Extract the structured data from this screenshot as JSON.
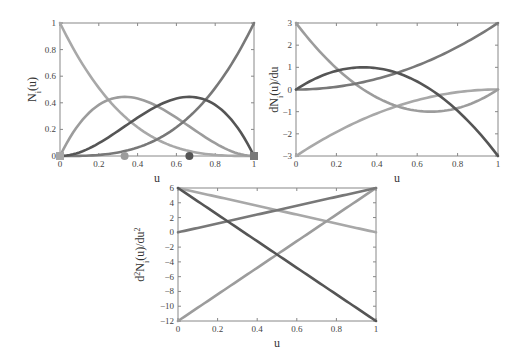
{
  "chart_data": [
    {
      "type": "line",
      "title": "",
      "xlabel": "u",
      "ylabel": "N_i(u)",
      "xlim": [
        0,
        1
      ],
      "ylim": [
        0,
        1
      ],
      "xticks": [
        "0",
        "0.2",
        "0.4",
        "0.6",
        "0.8",
        "1"
      ],
      "yticks": [
        "0",
        "0.2",
        "0.4",
        "0.6",
        "0.8",
        "1"
      ],
      "grid": false,
      "x": [
        0,
        0.1,
        0.2,
        0.3,
        0.4,
        0.5,
        0.6,
        0.7,
        0.8,
        0.9,
        1.0
      ],
      "series": [
        {
          "name": "N0",
          "color": "#a8a8a8",
          "values": [
            1.0,
            0.729,
            0.512,
            0.343,
            0.216,
            0.125,
            0.064,
            0.027,
            0.008,
            0.001,
            0.0
          ]
        },
        {
          "name": "N1",
          "color": "#9c9c9c",
          "values": [
            0.0,
            0.243,
            0.384,
            0.441,
            0.432,
            0.375,
            0.288,
            0.189,
            0.096,
            0.027,
            0.0
          ]
        },
        {
          "name": "N2",
          "color": "#555555",
          "values": [
            0.0,
            0.027,
            0.096,
            0.189,
            0.288,
            0.375,
            0.432,
            0.441,
            0.384,
            0.243,
            0.0
          ]
        },
        {
          "name": "N3",
          "color": "#787878",
          "values": [
            0.0,
            0.001,
            0.008,
            0.027,
            0.064,
            0.125,
            0.216,
            0.343,
            0.512,
            0.729,
            1.0
          ]
        }
      ],
      "markers": [
        {
          "shape": "square",
          "u": 0,
          "value": 0,
          "color": "#a8a8a8"
        },
        {
          "shape": "circle",
          "u": 0.333,
          "value": 0,
          "color": "#9c9c9c"
        },
        {
          "shape": "circle",
          "u": 0.667,
          "value": 0,
          "color": "#555555"
        },
        {
          "shape": "square",
          "u": 1,
          "value": 0,
          "color": "#787878"
        }
      ]
    },
    {
      "type": "line",
      "title": "",
      "xlabel": "u",
      "ylabel": "dN_i(u)/du",
      "xlim": [
        0,
        1
      ],
      "ylim": [
        -3,
        3
      ],
      "xticks": [
        "0",
        "0.2",
        "0.4",
        "0.6",
        "0.8",
        "1"
      ],
      "yticks": [
        "-3",
        "-2",
        "-1",
        "0",
        "1",
        "2",
        "3"
      ],
      "grid": false,
      "x": [
        0,
        0.1,
        0.2,
        0.3,
        0.4,
        0.5,
        0.6,
        0.7,
        0.8,
        0.9,
        1.0
      ],
      "series": [
        {
          "name": "dN0",
          "color": "#a8a8a8",
          "values": [
            -3.0,
            -2.43,
            -1.92,
            -1.47,
            -1.08,
            -0.75,
            -0.48,
            -0.27,
            -0.12,
            -0.03,
            0.0
          ]
        },
        {
          "name": "dN1",
          "color": "#9c9c9c",
          "values": [
            3.0,
            1.89,
            0.96,
            0.21,
            -0.36,
            -0.75,
            -0.96,
            -0.99,
            -0.84,
            -0.51,
            0.0
          ]
        },
        {
          "name": "dN2",
          "color": "#555555",
          "values": [
            0.0,
            0.51,
            0.84,
            0.99,
            0.96,
            0.75,
            0.36,
            -0.21,
            -0.96,
            -1.89,
            -3.0
          ]
        },
        {
          "name": "dN3",
          "color": "#787878",
          "values": [
            0.0,
            0.03,
            0.12,
            0.27,
            0.48,
            0.75,
            1.08,
            1.47,
            1.92,
            2.43,
            3.0
          ]
        }
      ]
    },
    {
      "type": "line",
      "title": "",
      "xlabel": "u",
      "ylabel": "d^2N_i(u)/du^2",
      "xlim": [
        0,
        1
      ],
      "ylim": [
        -12,
        6
      ],
      "xticks": [
        "0",
        "0.2",
        "0.4",
        "0.6",
        "0.8",
        "1"
      ],
      "yticks": [
        "-12",
        "-10",
        "-8",
        "-6",
        "-4",
        "-2",
        "0",
        "2",
        "4",
        "6"
      ],
      "grid": false,
      "x": [
        0,
        1
      ],
      "series": [
        {
          "name": "d2N0",
          "color": "#a8a8a8",
          "values": [
            6,
            0
          ]
        },
        {
          "name": "d2N1",
          "color": "#9c9c9c",
          "values": [
            -12,
            6
          ]
        },
        {
          "name": "d2N2",
          "color": "#555555",
          "values": [
            6,
            -12
          ]
        },
        {
          "name": "d2N3",
          "color": "#787878",
          "values": [
            0,
            6
          ]
        }
      ]
    }
  ],
  "labels": {
    "plot1": {
      "xlabel": "u",
      "ylabel_main": "N",
      "ylabel_sub": "i",
      "ylabel_tail": "(u)"
    },
    "plot2": {
      "xlabel": "u",
      "ylabel_main": "dN",
      "ylabel_sub": "i",
      "ylabel_tail": "(u)/du"
    },
    "plot3": {
      "xlabel": "u",
      "ylabel_pre": "d",
      "ylabel_sup": "2",
      "ylabel_main": "N",
      "ylabel_sub": "i",
      "ylabel_tail": "(u)/du",
      "ylabel_sup2": "2"
    }
  }
}
